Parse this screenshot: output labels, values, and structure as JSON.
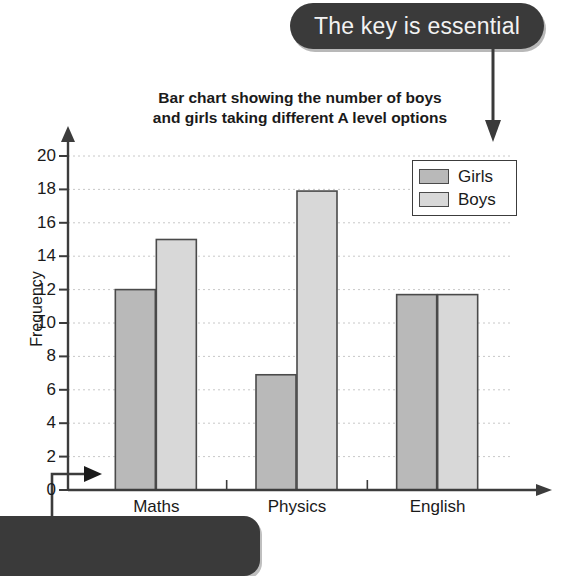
{
  "callouts": {
    "top": "The key is essential",
    "bottom": ""
  },
  "chart_data": {
    "type": "bar",
    "title": "Bar chart showing the number of boys and girls taking different A level options",
    "title_line1": "Bar chart showing the number of boys",
    "title_line2": "and girls taking different A level options",
    "xlabel": "",
    "ylabel": "Frequency",
    "categories": [
      "Maths",
      "Physics",
      "English"
    ],
    "series": [
      {
        "name": "Girls",
        "color": "#b9b9b9",
        "values": [
          12,
          6.9,
          11.7
        ]
      },
      {
        "name": "Boys",
        "color": "#d8d8d8",
        "values": [
          15,
          17.9,
          11.7
        ]
      }
    ],
    "ylim": [
      0,
      20
    ],
    "ytick_step": 2,
    "yticks": [
      20,
      18,
      16,
      14,
      12,
      10,
      8,
      6,
      4,
      2,
      0
    ],
    "grid": true,
    "legend_position": "top-right",
    "legend_entries": [
      "Girls",
      "Boys"
    ]
  },
  "axis": {
    "y_arrow": "up-arrow-icon",
    "x_arrow": "right-arrow-icon"
  }
}
